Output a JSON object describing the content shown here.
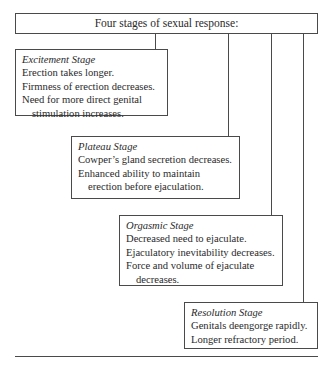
{
  "diagram": {
    "title": "Four stages of sexual response:",
    "stages": [
      {
        "name": "Excitement Stage",
        "lines": [
          "Erection takes longer.",
          "Firmness of erection decreases.",
          "Need for more direct genital",
          "stimulation increases."
        ]
      },
      {
        "name": "Plateau Stage",
        "lines": [
          "Cowper’s gland secretion decreases.",
          "Enhanced ability to maintain",
          "erection before ejaculation."
        ]
      },
      {
        "name": "Orgasmic Stage",
        "lines": [
          "Decreased need to ejaculate.",
          "Ejaculatory inevitability decreases.",
          "Force and volume of ejaculate",
          "decreases."
        ]
      },
      {
        "name": "Resolution Stage",
        "lines": [
          "Genitals deengorge rapidly.",
          "Longer refractory period."
        ]
      }
    ]
  }
}
